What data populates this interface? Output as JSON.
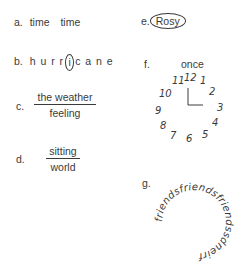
{
  "puzzles": {
    "a": {
      "label": "a.",
      "word1": "time",
      "word2": "time"
    },
    "b": {
      "label": "b.",
      "before": "h u r r",
      "circled": "i",
      "after": "c a n e"
    },
    "c": {
      "label": "c.",
      "numerator": "the weather",
      "denominator": "feeling"
    },
    "d": {
      "label": "d.",
      "numerator": "sitting",
      "denominator": "world"
    },
    "e": {
      "label": "e.",
      "circled_word": "Rosy"
    },
    "f": {
      "label": "f.",
      "caption": "once",
      "clock_numbers": [
        "12",
        "1",
        "2",
        "3",
        "4",
        "5",
        "6",
        "7",
        "8",
        "9",
        "10",
        "11"
      ]
    },
    "g": {
      "label": "g.",
      "ring_text": "friendsfriendsfriendssdneirf"
    }
  }
}
